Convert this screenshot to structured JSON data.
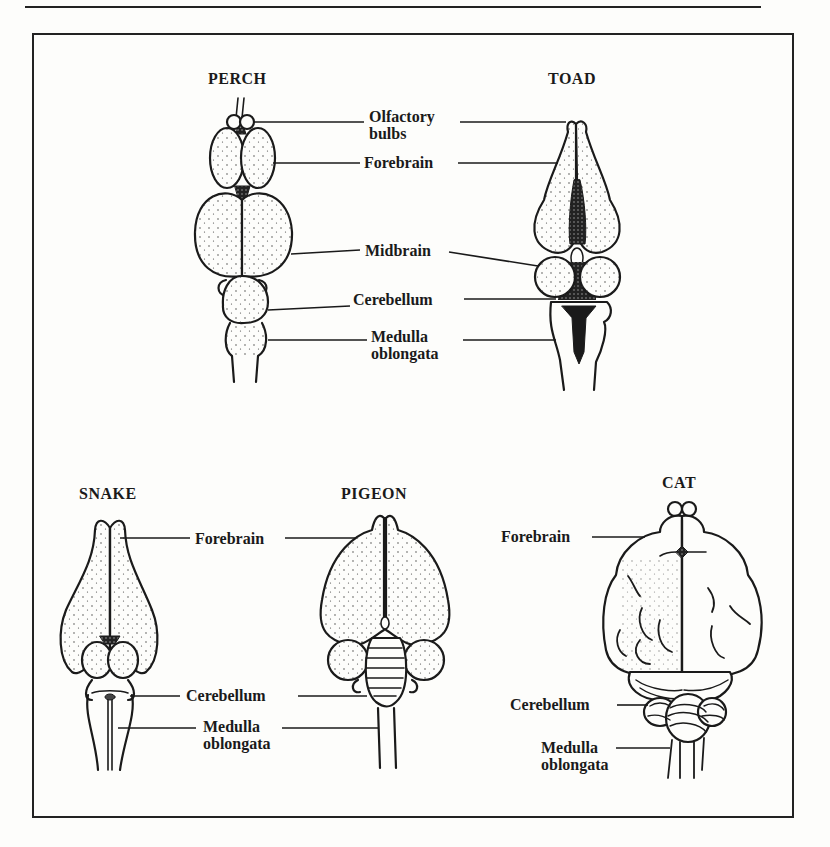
{
  "figure": {
    "panels": [
      {
        "animal": "PERCH",
        "labels": [
          "Olfactory bulbs",
          "Forebrain",
          "Midbrain",
          "Cerebellum",
          "Medulla oblongata"
        ]
      },
      {
        "animal": "TOAD",
        "labels": [
          "Olfactory bulbs",
          "Forebrain",
          "Midbrain",
          "Cerebellum",
          "Medulla oblongata"
        ]
      },
      {
        "animal": "SNAKE",
        "labels": [
          "Forebrain",
          "Cerebellum",
          "Medulla oblongata"
        ]
      },
      {
        "animal": "PIGEON",
        "labels": [
          "Forebrain",
          "Cerebellum",
          "Medulla oblongata"
        ]
      },
      {
        "animal": "CAT",
        "labels": [
          "Forebrain",
          "Cerebellum",
          "Medulla oblongata"
        ]
      }
    ]
  },
  "titles": {
    "perch": "PERCH",
    "toad": "TOAD",
    "snake": "SNAKE",
    "pigeon": "PIGEON",
    "cat": "CAT"
  },
  "labels": {
    "top": {
      "olfactory_1": "Olfactory",
      "olfactory_2": "bulbs",
      "forebrain": "Forebrain",
      "midbrain": "Midbrain",
      "cerebellum": "Cerebellum",
      "medulla_1": "Medulla",
      "medulla_2": "oblongata"
    },
    "bottom_left": {
      "forebrain": "Forebrain",
      "cerebellum": "Cerebellum",
      "medulla_1": "Medulla",
      "medulla_2": "oblongata"
    },
    "cat": {
      "forebrain": "Forebrain",
      "cerebellum": "Cerebellum",
      "medulla_1": "Medulla",
      "medulla_2": "oblongata"
    }
  },
  "colors": {
    "ink": "#1a1a1a",
    "paper": "#fdfdfb"
  }
}
